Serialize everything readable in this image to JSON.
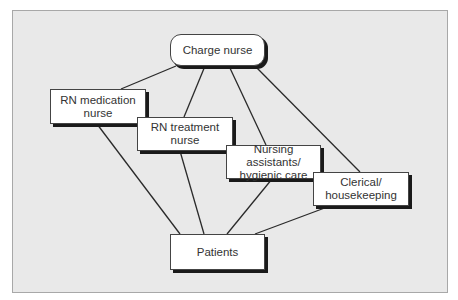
{
  "diagram": {
    "type": "organizational-network",
    "colors": {
      "background": "#e9e9e9",
      "node_fill": "#ffffff",
      "line": "#2a2a2a",
      "shadow": "#1a1a1a",
      "text": "#333333"
    },
    "nodes": {
      "charge": "Charge nurse",
      "rn_medication": "RN medication nurse",
      "rn_treatment": "RN treatment nurse",
      "nursing_assistants": "Nursing assistants/ hygienic care",
      "clerical": "Clerical/ housekeeping",
      "patients": "Patients"
    },
    "edges": [
      [
        "charge",
        "rn_medication"
      ],
      [
        "charge",
        "rn_treatment"
      ],
      [
        "charge",
        "nursing_assistants"
      ],
      [
        "charge",
        "clerical"
      ],
      [
        "rn_medication",
        "patients"
      ],
      [
        "rn_treatment",
        "patients"
      ],
      [
        "nursing_assistants",
        "patients"
      ],
      [
        "clerical",
        "patients"
      ]
    ]
  }
}
